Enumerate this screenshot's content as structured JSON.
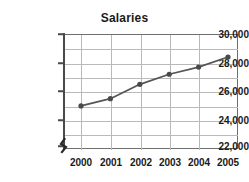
{
  "chart_data": {
    "type": "line",
    "title": "Salaries",
    "xlabel": "",
    "ylabel": "",
    "categories": [
      "2000",
      "2001",
      "2002",
      "2003",
      "2004",
      "2005"
    ],
    "x": [
      2000,
      2001,
      2002,
      2003,
      2004,
      2005
    ],
    "values": [
      25000,
      25500,
      26500,
      27200,
      27700,
      28400
    ],
    "series": [
      {
        "name": "Salaries",
        "values": [
          25000,
          25500,
          26500,
          27200,
          27700,
          28400
        ]
      }
    ],
    "ylim": [
      22000,
      30000
    ],
    "ytick_labels": [
      "30,000",
      "28,000",
      "26,000",
      "24,000",
      "22,000"
    ],
    "ytick_values": [
      30000,
      28000,
      26000,
      24000,
      22000
    ],
    "yminor_step": 1000,
    "xtick_labels": [
      "2000",
      "2001",
      "2002",
      "2003",
      "2004",
      "2005"
    ],
    "grid": true,
    "legend": "none",
    "axis_break": true,
    "marker": "filled-circle",
    "line_color": "#555555",
    "marker_color": "#4a4a4a",
    "grid_color": "#b9b9b9",
    "axis_color": "#4a4a4a",
    "text_color": "#1a1a1a",
    "background": "#ffffff"
  }
}
